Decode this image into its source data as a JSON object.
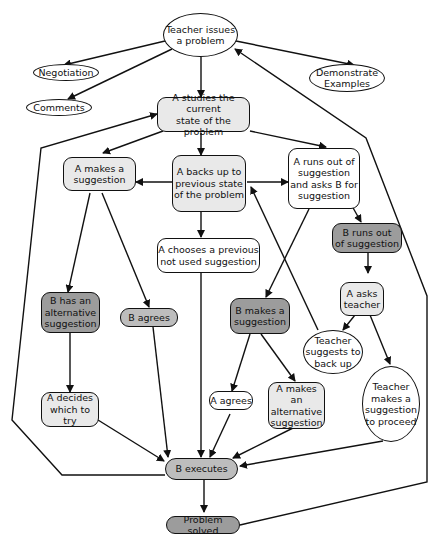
{
  "diagram": {
    "colors": {
      "line": "#111111",
      "white": "#ffffff",
      "light": "#e9e9e9",
      "mid": "#bdbdbd",
      "dark": "#9c9c9c"
    },
    "nodes": {
      "teacher_issues": {
        "label": "Teacher issues\na problem"
      },
      "negotiation": {
        "label": "Negotiation"
      },
      "comments": {
        "label": "Comments"
      },
      "demonstrate": {
        "label": "Demonstrate\nExamples"
      },
      "a_studies": {
        "label": "A studies the current\nstate of the problem"
      },
      "a_makes_suggestion": {
        "label": "A  makes a\nsuggestion"
      },
      "a_backs_up": {
        "label": "A backs up to\nprevious state\nof the problem"
      },
      "a_runs_out": {
        "label": "A runs out of\nsuggestion\nand asks B for\nsuggestion"
      },
      "b_runs_out": {
        "label": "B runs out\nof suggestion"
      },
      "a_chooses": {
        "label": "A chooses a previous\nnot used suggestion"
      },
      "b_has_alt": {
        "label": "B has an\nalternative\nsuggestion"
      },
      "b_agrees": {
        "label": "B agrees"
      },
      "b_makes_suggestion": {
        "label": "B makes a\nsuggestion"
      },
      "a_asks_teacher": {
        "label": "A asks\nteacher"
      },
      "teacher_back_up": {
        "label": "Teacher\nsuggests to\nback up"
      },
      "teacher_proceed": {
        "label": "Teacher\nmakes a\nsuggestion\nto proceed"
      },
      "a_decides": {
        "label": "A decides\nwhich to try"
      },
      "a_agrees": {
        "label": "A agrees"
      },
      "a_makes_alt": {
        "label": "A makes an\nalternative\nsuggestion"
      },
      "b_executes": {
        "label": "B executes"
      },
      "problem_solved": {
        "label": "Problem solved"
      }
    }
  }
}
